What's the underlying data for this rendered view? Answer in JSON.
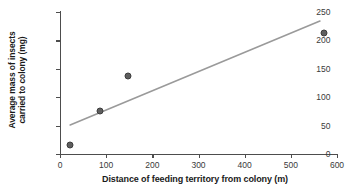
{
  "chart_data": {
    "type": "scatter",
    "title": "",
    "xlabel": "Distance of feeding territory from colony (m)",
    "ylabel_line1": "Average mass of insects",
    "ylabel_line2": "carried to colony (mg)",
    "ylabel": "Average mass of insects carried to colony (mg)",
    "xlim": [
      0,
      600
    ],
    "ylim": [
      0,
      250
    ],
    "xticks": [
      0,
      100,
      200,
      300,
      400,
      500,
      600
    ],
    "yticks": [
      0,
      50,
      100,
      150,
      200,
      250
    ],
    "xtick_labels": [
      "0",
      "100",
      "200",
      "300",
      "400",
      "500",
      "600"
    ],
    "ytick_labels": [
      "0",
      "50",
      "100",
      "150",
      "200",
      "250"
    ],
    "grid": false,
    "legend": false,
    "series": [
      {
        "name": "Feeding territory data",
        "marker": "filled-circle",
        "color": "#5e5e5e",
        "x": [
          22,
          87,
          147,
          572
        ],
        "y": [
          16,
          76,
          137,
          213
        ],
        "points": [
          {
            "x": 22,
            "y": 16
          },
          {
            "x": 87,
            "y": 76
          },
          {
            "x": 147,
            "y": 137
          },
          {
            "x": 572,
            "y": 213
          }
        ]
      }
    ],
    "trendline": {
      "name": "Line of best fit",
      "color": "#9a9a9a",
      "x_start": 22,
      "y_start": 51,
      "x_end": 563,
      "y_end": 234,
      "slope": 0.338,
      "intercept": 43.6
    },
    "colors": {
      "marker": "#5e5e5e",
      "marker_edge": "#3d3d3d",
      "trendline": "#9a9a9a",
      "axis": "#4d4d4d",
      "text": "#1a1a1a",
      "background": "#ffffff"
    }
  }
}
